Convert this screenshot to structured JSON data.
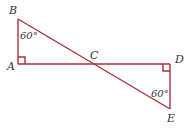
{
  "diagram": {
    "line_color": "#a8333a",
    "points": {
      "A": {
        "label": "A"
      },
      "B": {
        "label": "B"
      },
      "C": {
        "label": "C"
      },
      "D": {
        "label": "D"
      },
      "E": {
        "label": "E"
      }
    },
    "angles": {
      "B": "60°",
      "E": "60°"
    },
    "right_angles": [
      "A",
      "D"
    ]
  }
}
